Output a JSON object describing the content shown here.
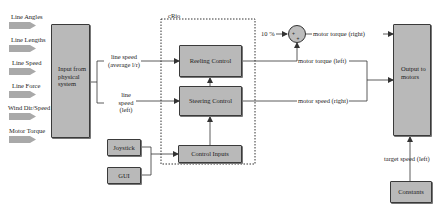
{
  "inputs": [
    {
      "label": "Line Angles"
    },
    {
      "label": "Line Lengths"
    },
    {
      "label": "Line Speed"
    },
    {
      "label": "Line Force"
    },
    {
      "label": "Wind Dir/Speed"
    },
    {
      "label": "Motor Torque"
    }
  ],
  "blocks": {
    "input_physical": "Input from physical system",
    "reeling_control": "Reeling Control",
    "steering_control": "Steering Control",
    "control_inputs": "Control Inputs",
    "joystick": "Joystick",
    "gui": "GUI",
    "output_motors": "Output to motors",
    "constants": "Constants"
  },
  "crio_label": "cRio",
  "summing_junction": {
    "input_label": "10 %",
    "signs": [
      "+",
      "+"
    ]
  },
  "signals": {
    "line_speed_avg": "line speed (average l/r)",
    "line_speed_left": "line speed (left)",
    "motor_torque_right": "motor torque (right)",
    "motor_torque_left": "motor torque (left)",
    "motor_speed_right": "motor speed (right)",
    "target_speed_left": "target speed (left)"
  },
  "colors": {
    "block_fill": "#b9b9b9",
    "block_border": "#3a3a3a",
    "input_arrow": "#a9a9a9",
    "wire": "#333333"
  }
}
